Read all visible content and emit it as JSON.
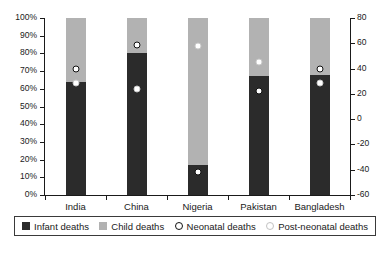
{
  "chart_data": {
    "type": "bar",
    "title": "",
    "subtitle": "",
    "xlabel": "",
    "ylabel": "",
    "categories": [
      "India",
      "China",
      "Nigeria",
      "Pakistan",
      "Bangladesh"
    ],
    "left_axis": {
      "label": "",
      "ticks": [
        "0%",
        "10%",
        "20%",
        "30%",
        "40%",
        "50%",
        "60%",
        "70%",
        "80%",
        "90%",
        "100%"
      ],
      "tick_values": [
        0,
        10,
        20,
        30,
        40,
        50,
        60,
        70,
        80,
        90,
        100
      ],
      "ylim": [
        0,
        100
      ],
      "unit": "percent"
    },
    "right_axis": {
      "label": "",
      "ticks": [
        "80",
        "60",
        "40",
        "20",
        "0",
        "-20",
        "-40",
        "-60"
      ],
      "tick_values": [
        80,
        60,
        40,
        20,
        0,
        -20,
        -40,
        -60
      ],
      "ylim": [
        -60,
        80
      ]
    },
    "grid": false,
    "legend_position": "bottom",
    "stacked": true,
    "series": [
      {
        "name": "Infant deaths",
        "kind": "bar-segment",
        "color": "#2b2b2b",
        "values": [
          64,
          80,
          17,
          67,
          68
        ]
      },
      {
        "name": "Child deaths",
        "kind": "bar-segment",
        "color": "#b2b2b2",
        "values": [
          36,
          20,
          83,
          33,
          32
        ]
      },
      {
        "name": "Neonatal deaths",
        "kind": "marker",
        "marker": "open-circle-dark",
        "values": [
          71,
          85,
          13,
          59,
          71
        ]
      },
      {
        "name": "Post-neonatal deaths",
        "kind": "marker",
        "marker": "open-circle-light",
        "values": [
          63,
          60,
          84,
          75,
          63
        ]
      }
    ]
  },
  "legend": {
    "items": [
      {
        "label": "Infant deaths",
        "swatch": "filled-square-dark"
      },
      {
        "label": "Child deaths",
        "swatch": "filled-square-light"
      },
      {
        "label": "Neonatal deaths",
        "swatch": "open-circle-dark"
      },
      {
        "label": "Post-neonatal deaths",
        "swatch": "open-circle-light"
      }
    ]
  },
  "caption": {
    "text": ""
  }
}
